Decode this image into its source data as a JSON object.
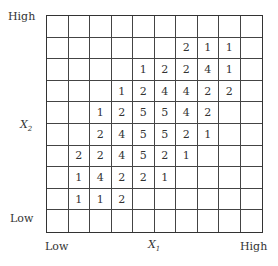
{
  "axes": {
    "y_high": "High",
    "y_low": "Low",
    "y_label": "X",
    "y_label_sub": "2",
    "x_low": "Low",
    "x_high": "High",
    "x_label": "X",
    "x_label_sub": "1"
  },
  "grid": {
    "rows": 10,
    "cols": 10,
    "cells": [
      [
        "",
        "",
        "",
        "",
        "",
        "",
        "",
        "",
        "",
        ""
      ],
      [
        "",
        "",
        "",
        "",
        "",
        "",
        "2",
        "1",
        "1",
        ""
      ],
      [
        "",
        "",
        "",
        "",
        "1",
        "2",
        "2",
        "4",
        "1",
        ""
      ],
      [
        "",
        "",
        "",
        "1",
        "2",
        "4",
        "4",
        "2",
        "2",
        ""
      ],
      [
        "",
        "",
        "1",
        "2",
        "5",
        "5",
        "4",
        "2",
        "",
        ""
      ],
      [
        "",
        "",
        "2",
        "4",
        "5",
        "5",
        "2",
        "1",
        "",
        ""
      ],
      [
        "",
        "2",
        "2",
        "4",
        "5",
        "2",
        "1",
        "",
        "",
        ""
      ],
      [
        "",
        "1",
        "4",
        "2",
        "2",
        "1",
        "",
        "",
        "",
        ""
      ],
      [
        "",
        "1",
        "1",
        "2",
        "",
        "",
        "",
        "",
        "",
        ""
      ],
      [
        "",
        "",
        "",
        "",
        "",
        "",
        "",
        "",
        "",
        ""
      ]
    ]
  }
}
